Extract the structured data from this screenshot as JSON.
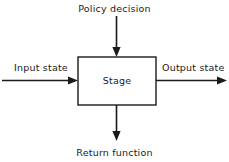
{
  "diagram": {
    "title_text": "Stage",
    "colors": {
      "background": "#ffffff",
      "stroke": "#1a1a1a",
      "text": "#1a1a1a",
      "box_fill": "#ffffff"
    },
    "box": {
      "label": "Stage"
    },
    "labels": {
      "top": "Policy decision",
      "left": "Input state",
      "right": "Output state",
      "bottom": "Return function"
    },
    "arrows": [
      {
        "name": "policy-decision-arrow",
        "direction": "down",
        "from": "top",
        "to": "box"
      },
      {
        "name": "input-state-arrow",
        "direction": "right",
        "from": "left",
        "to": "box"
      },
      {
        "name": "output-state-arrow",
        "direction": "right",
        "from": "box",
        "to": "right"
      },
      {
        "name": "return-function-arrow",
        "direction": "down",
        "from": "box",
        "to": "bottom"
      }
    ]
  }
}
